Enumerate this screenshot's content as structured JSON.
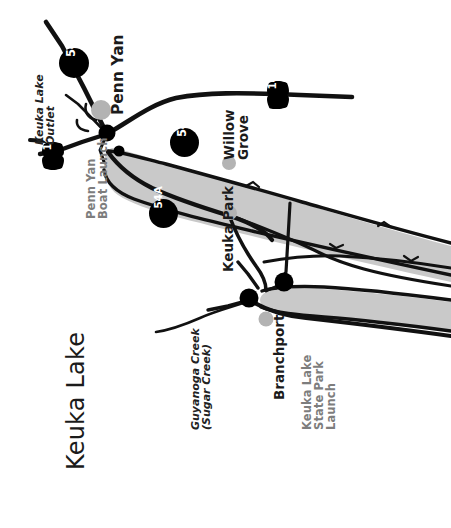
{
  "map": {
    "title": "Keuka Lake",
    "orientation_note": "rotated",
    "colors": {
      "lake_fill": "#c9c9c9",
      "road": "#111111",
      "shield": "#000000",
      "shield_text": "#ffffff",
      "launch_label": "#7d7d7d",
      "town_label": "#1b1b1b",
      "town_marker": "#b3b3b3",
      "launch_marker": "#000000",
      "background": "#ffffff"
    },
    "towns": [
      {
        "name": "Penn Yan",
        "marker": "town-marker"
      },
      {
        "name": "Willow Grove",
        "marker": "town-marker"
      },
      {
        "name": "Keuka Park",
        "marker": "town-marker"
      },
      {
        "name": "Branchport",
        "marker": "town-marker"
      }
    ],
    "launches": [
      {
        "name": "Penn Yan\nBoat Launch",
        "marker": "launch-marker"
      },
      {
        "name": "Keuka Lake\nState Park\nLaunch",
        "marker": "launch-marker"
      }
    ],
    "waterways": [
      {
        "name": "Keuka Lake\nOutlet"
      },
      {
        "name": "Guyanoga Creek\n(Sugar Creek)"
      }
    ],
    "route_shields": [
      {
        "label": "54",
        "shape": "circle"
      },
      {
        "label": "54",
        "shape": "circle"
      },
      {
        "label": "54A",
        "shape": "circle"
      },
      {
        "label": "14A",
        "shape": "shield"
      },
      {
        "label": "14A",
        "shape": "shield"
      }
    ],
    "labels": {
      "penn_yan": "Penn Yan",
      "willow_grove": "Willow\nGrove",
      "keuka_park": "Keuka Park",
      "branchport": "Branchport",
      "penn_yan_boat_launch": "Penn Yan\nBoat Launch",
      "state_park_launch": "Keuka Lake\nState Park\nLaunch",
      "keuka_lake_outlet": "Keuka Lake\nOutlet",
      "guyanoga_creek": "Guyanoga Creek\n(Sugar Creek)",
      "route_54_north": "54",
      "route_54_mid": "54",
      "route_54a": "54A",
      "route_14a_west": "14A",
      "route_14a_east": "14A"
    }
  }
}
